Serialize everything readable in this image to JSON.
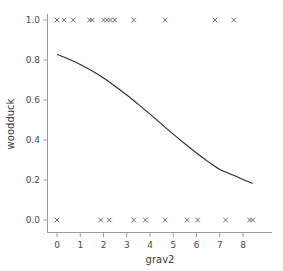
{
  "chart_data": {
    "type": "scatter",
    "title": "",
    "xlabel": "grav2",
    "ylabel": "woodduck",
    "xlim": [
      -0.45,
      8.85
    ],
    "ylim": [
      -0.06,
      1.06
    ],
    "grid": false,
    "legend": null,
    "xticks": [
      0,
      1,
      2,
      3,
      4,
      5,
      6,
      7,
      8
    ],
    "xticklabels": [
      "0",
      "1",
      "2",
      "3",
      "4",
      "5",
      "6",
      "7",
      "8"
    ],
    "yticks": [
      0.0,
      0.2,
      0.4,
      0.6,
      0.8,
      1.0
    ],
    "yticklabels": [
      "0.0",
      "0.2",
      "0.4",
      "0.6",
      "0.8",
      "1.0"
    ],
    "series": [
      {
        "name": "observations",
        "type": "scatter",
        "marker": "x",
        "color": "#5a5a5a",
        "points": [
          {
            "x": 0.0,
            "y": 1.0
          },
          {
            "x": 0.3,
            "y": 1.0
          },
          {
            "x": 0.7,
            "y": 1.0
          },
          {
            "x": 1.4,
            "y": 1.0
          },
          {
            "x": 1.52,
            "y": 1.0
          },
          {
            "x": 2.0,
            "y": 1.0
          },
          {
            "x": 2.15,
            "y": 1.0
          },
          {
            "x": 2.3,
            "y": 1.0
          },
          {
            "x": 2.48,
            "y": 1.0
          },
          {
            "x": 3.3,
            "y": 1.0
          },
          {
            "x": 4.65,
            "y": 1.0
          },
          {
            "x": 6.8,
            "y": 1.0
          },
          {
            "x": 7.6,
            "y": 1.0
          },
          {
            "x": 0.0,
            "y": 0.0
          },
          {
            "x": 1.88,
            "y": 0.0
          },
          {
            "x": 2.25,
            "y": 0.0
          },
          {
            "x": 3.3,
            "y": 0.0
          },
          {
            "x": 3.8,
            "y": 0.0
          },
          {
            "x": 4.65,
            "y": 0.0
          },
          {
            "x": 5.6,
            "y": 0.0
          },
          {
            "x": 6.05,
            "y": 0.0
          },
          {
            "x": 7.25,
            "y": 0.0
          },
          {
            "x": 8.28,
            "y": 0.0
          },
          {
            "x": 8.42,
            "y": 0.0
          }
        ]
      },
      {
        "name": "fitted-logistic",
        "type": "line",
        "color": "#2b2b2b",
        "points": [
          {
            "x": 0.0,
            "y": 0.828
          },
          {
            "x": 0.5,
            "y": 0.805
          },
          {
            "x": 1.0,
            "y": 0.778
          },
          {
            "x": 1.5,
            "y": 0.746
          },
          {
            "x": 2.0,
            "y": 0.71
          },
          {
            "x": 2.5,
            "y": 0.669
          },
          {
            "x": 3.0,
            "y": 0.625
          },
          {
            "x": 3.5,
            "y": 0.578
          },
          {
            "x": 4.0,
            "y": 0.529
          },
          {
            "x": 4.5,
            "y": 0.479
          },
          {
            "x": 5.0,
            "y": 0.429
          },
          {
            "x": 5.5,
            "y": 0.381
          },
          {
            "x": 6.0,
            "y": 0.335
          },
          {
            "x": 6.5,
            "y": 0.292
          },
          {
            "x": 7.0,
            "y": 0.253
          },
          {
            "x": 7.5,
            "y": 0.228
          },
          {
            "x": 8.0,
            "y": 0.203
          },
          {
            "x": 8.42,
            "y": 0.183
          }
        ]
      }
    ]
  }
}
